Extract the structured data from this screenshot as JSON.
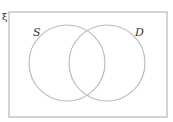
{
  "diagram": {
    "type": "venn",
    "universal_set_label": "ξ",
    "sets": [
      {
        "label": "S",
        "cx": 67,
        "cy": 63,
        "r": 38
      },
      {
        "label": "D",
        "cx": 107,
        "cy": 63,
        "r": 38
      }
    ],
    "rect": {
      "x": 9,
      "y": 12,
      "width": 158,
      "height": 105
    },
    "colors": {
      "rect_stroke": "#b8b8b8",
      "circle_stroke": "#bdbdbd",
      "text": "#333333"
    }
  }
}
